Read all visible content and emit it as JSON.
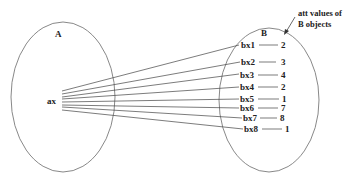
{
  "diagram": {
    "set_a": {
      "label": "A",
      "element": "ax"
    },
    "set_b": {
      "label": "B"
    },
    "annotation": {
      "line1": "att values of",
      "line2": "B objects"
    },
    "mappings": [
      {
        "label": "bx1",
        "value": "2"
      },
      {
        "label": "bx2",
        "value": "3"
      },
      {
        "label": "bx3",
        "value": "4"
      },
      {
        "label": "bx4",
        "value": "2"
      },
      {
        "label": "bx5",
        "value": "1"
      },
      {
        "label": "bx6",
        "value": "7"
      },
      {
        "label": "bx7",
        "value": "8"
      },
      {
        "label": "bx8",
        "value": "1"
      }
    ],
    "colors": {
      "ellipse_stroke": "#7a7a7a",
      "line_stroke": "#444444",
      "text": "#222222"
    }
  }
}
